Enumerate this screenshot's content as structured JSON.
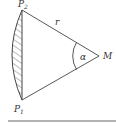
{
  "diagram": {
    "points": {
      "P1": {
        "label": "P",
        "subscript": "1"
      },
      "P2": {
        "label": "P",
        "subscript": "2"
      },
      "M": {
        "label": "M"
      }
    },
    "radius_label": "r",
    "angle_label": "α",
    "colors": {
      "stroke": "#444444",
      "text": "#333333",
      "background": "#ffffff"
    }
  }
}
